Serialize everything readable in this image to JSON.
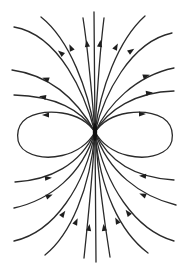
{
  "diagram": {
    "type": "dipole-field-lines",
    "width": 191,
    "height": 268,
    "colors": {
      "background": "#ffffff",
      "line": "#2a2a2a",
      "arrow": "#1e1e1e"
    },
    "center": {
      "x": 95,
      "y": 132
    },
    "lines": [
      {
        "id": "top-vertical",
        "d": "M95 132 L94 12",
        "arrows": []
      },
      {
        "id": "top-inner-left",
        "d": "M95 132 C92 95 88 50 83 18",
        "arrows": [
          {
            "x": 87,
            "y": 44,
            "angle": -98
          }
        ]
      },
      {
        "id": "top-inner-right",
        "d": "M95 132 C97 95 100 50 104 18",
        "arrows": [
          {
            "x": 100,
            "y": 44,
            "angle": -82
          }
        ]
      },
      {
        "id": "top-mid-left",
        "d": "M95 132 C88 90 70 40 41 17",
        "arrows": [
          {
            "x": 71,
            "y": 48,
            "angle": -115
          }
        ]
      },
      {
        "id": "top-mid-right",
        "d": "M95 132 C100 90 118 40 145 16",
        "arrows": [
          {
            "x": 116,
            "y": 47,
            "angle": -62
          }
        ]
      },
      {
        "id": "top-outer-left",
        "d": "M95 132 C85 95 60 35 14 27",
        "arrows": [
          {
            "x": 61,
            "y": 53,
            "angle": -140
          }
        ]
      },
      {
        "id": "top-outer-right",
        "d": "M95 132 C104 95 130 42 172 33",
        "arrows": [
          {
            "x": 131,
            "y": 51,
            "angle": -35
          }
        ]
      },
      {
        "id": "upper-left-1",
        "d": "M95 132 C80 105 55 76 12 70",
        "arrows": [
          {
            "x": 46,
            "y": 79,
            "angle": 200
          }
        ]
      },
      {
        "id": "upper-right-1",
        "d": "M95 132 C108 105 135 76 174 68",
        "arrows": [
          {
            "x": 146,
            "y": 76,
            "angle": -18
          }
        ]
      },
      {
        "id": "upper-left-2",
        "d": "M95 132 C82 110 55 96 14 95",
        "arrows": [
          {
            "x": 43,
            "y": 97,
            "angle": 190
          }
        ]
      },
      {
        "id": "upper-right-2",
        "d": "M95 132 C108 110 135 92 174 91",
        "arrows": [
          {
            "x": 149,
            "y": 93,
            "angle": -8
          }
        ]
      },
      {
        "id": "loop-left",
        "d": "M95 132 C80 110 45 108 27 118 C15 126 14 145 27 152 C45 162 80 158 95 132",
        "arrows": [
          {
            "x": 46,
            "y": 115,
            "angle": 180
          }
        ]
      },
      {
        "id": "loop-right",
        "d": "M95 132 C110 110 145 108 163 118 C175 126 176 145 163 152 C145 162 110 158 95 132",
        "arrows": [
          {
            "x": 142,
            "y": 114,
            "angle": 0
          }
        ]
      },
      {
        "id": "lower-left-1",
        "d": "M15 182 C50 180 80 165 95 132",
        "arrows": [
          {
            "x": 48,
            "y": 178,
            "angle": -5
          }
        ]
      },
      {
        "id": "lower-right-1",
        "d": "M174 180 C140 178 110 165 95 132",
        "arrows": [
          {
            "x": 143,
            "y": 176,
            "angle": 185
          }
        ]
      },
      {
        "id": "lower-left-2",
        "d": "M14 208 C50 200 82 175 95 132",
        "arrows": [
          {
            "x": 49,
            "y": 196,
            "angle": -22
          }
        ]
      },
      {
        "id": "lower-right-2",
        "d": "M176 205 C140 196 108 172 95 132",
        "arrows": [
          {
            "x": 143,
            "y": 195,
            "angle": 202
          }
        ]
      },
      {
        "id": "lower-left-3",
        "d": "M14 241 C55 232 85 185 95 132",
        "arrows": [
          {
            "x": 63,
            "y": 214,
            "angle": -55
          }
        ]
      },
      {
        "id": "lower-right-3",
        "d": "M174 241 C135 230 105 185 95 132",
        "arrows": [
          {
            "x": 128,
            "y": 213,
            "angle": 233
          }
        ]
      },
      {
        "id": "lower-mid-left",
        "d": "M45 255 C70 235 90 190 95 132",
        "arrows": [
          {
            "x": 76,
            "y": 222,
            "angle": -65
          }
        ]
      },
      {
        "id": "lower-mid-right",
        "d": "M148 253 C120 232 100 190 95 132",
        "arrows": [
          {
            "x": 117,
            "y": 221,
            "angle": 243
          }
        ]
      },
      {
        "id": "bottom-inner-left",
        "d": "M84 258 C88 220 93 170 95 132",
        "arrows": [
          {
            "x": 89,
            "y": 228,
            "angle": -82
          }
        ]
      },
      {
        "id": "bottom-inner-right",
        "d": "M110 257 C104 220 98 170 95 132",
        "arrows": [
          {
            "x": 104,
            "y": 228,
            "angle": 262
          }
        ]
      },
      {
        "id": "bottom-vertical",
        "d": "M95 132 L96 262",
        "arrows": []
      }
    ]
  }
}
